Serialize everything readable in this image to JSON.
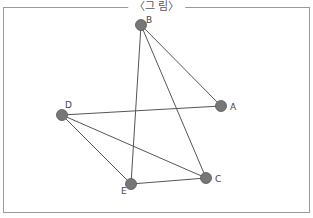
{
  "title": "〈그 림〉",
  "colors": {
    "node": "#777777",
    "edge": "#555555",
    "border": "#9a9a9a"
  },
  "nodes": [
    {
      "id": "A",
      "x": 221,
      "y": 106,
      "label_dx": 9,
      "label_dy": 4
    },
    {
      "id": "B",
      "x": 141,
      "y": 25,
      "label_dx": 5,
      "label_dy": -2
    },
    {
      "id": "C",
      "x": 206,
      "y": 178,
      "label_dx": 9,
      "label_dy": 4
    },
    {
      "id": "D",
      "x": 62,
      "y": 115,
      "label_dx": 3,
      "label_dy": -7
    },
    {
      "id": "E",
      "x": 131,
      "y": 184,
      "label_dx": -10,
      "label_dy": 10
    }
  ],
  "edges": [
    [
      "B",
      "A"
    ],
    [
      "B",
      "E"
    ],
    [
      "B",
      "C"
    ],
    [
      "D",
      "A"
    ],
    [
      "D",
      "E"
    ],
    [
      "D",
      "C"
    ],
    [
      "E",
      "C"
    ]
  ]
}
